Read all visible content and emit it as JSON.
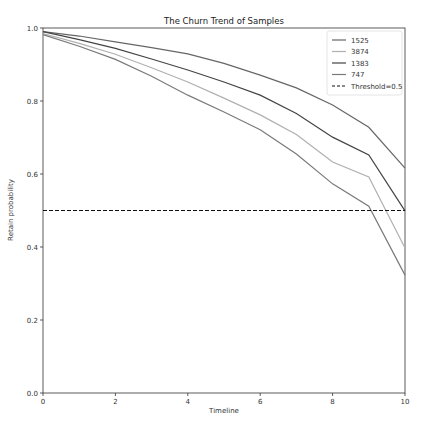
{
  "chart_data": {
    "type": "line",
    "title": "The Churn Trend of Samples",
    "xlabel": "Timeline",
    "ylabel": "Retain probability",
    "xlim": [
      0,
      10
    ],
    "ylim": [
      0.0,
      1.0
    ],
    "xticks": [
      "0",
      "2",
      "4",
      "6",
      "8",
      "10"
    ],
    "yticks": [
      "0.0",
      "0.2",
      "0.4",
      "0.6",
      "0.8",
      "1.0"
    ],
    "grid": false,
    "legend_position": "upper right",
    "x": [
      0,
      1,
      2,
      3,
      4,
      5,
      6,
      7,
      8,
      9,
      10
    ],
    "series": [
      {
        "name": "1525",
        "color": "#666666",
        "values": [
          0.99,
          0.978,
          0.962,
          0.946,
          0.929,
          0.903,
          0.871,
          0.836,
          0.789,
          0.728,
          0.616
        ]
      },
      {
        "name": "3874",
        "color": "#b0b0b0",
        "values": [
          0.985,
          0.958,
          0.928,
          0.891,
          0.852,
          0.808,
          0.762,
          0.708,
          0.633,
          0.592,
          0.397
        ]
      },
      {
        "name": "1383",
        "color": "#444444",
        "values": [
          0.99,
          0.968,
          0.944,
          0.915,
          0.885,
          0.852,
          0.816,
          0.766,
          0.701,
          0.652,
          0.499
        ]
      },
      {
        "name": "747",
        "color": "#7a7a7a",
        "values": [
          0.982,
          0.95,
          0.914,
          0.868,
          0.816,
          0.77,
          0.721,
          0.655,
          0.573,
          0.512,
          0.323
        ]
      }
    ],
    "threshold": {
      "name": "Threshold=0.5",
      "value": 0.5,
      "style": "dashed",
      "color": "#111111"
    }
  }
}
